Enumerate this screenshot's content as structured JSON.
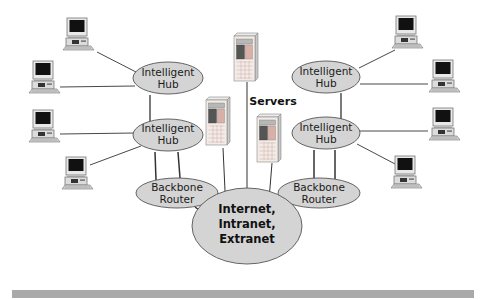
{
  "diagram": {
    "nodes": {
      "left_hub_top": {
        "label_line1": "Intelligent",
        "label_line2": "Hub"
      },
      "left_hub_bottom": {
        "label_line1": "Intelligent",
        "label_line2": "Hub"
      },
      "left_router": {
        "label_line1": "Backbone",
        "label_line2": "Router"
      },
      "right_hub_top": {
        "label_line1": "Intelligent",
        "label_line2": "Hub"
      },
      "right_hub_bottom": {
        "label_line1": "Intelligent",
        "label_line2": "Hub"
      },
      "right_router": {
        "label_line1": "Backbone",
        "label_line2": "Router"
      },
      "internet": {
        "line1": "Internet,",
        "line2": "Intranet,",
        "line3": "Extranet"
      }
    },
    "servers_label": "Servers",
    "computers_count": 8,
    "servers_count": 3,
    "colors": {
      "ellipse_fill": "#d4d4d4",
      "ellipse_stroke": "#555555",
      "line": "#333333",
      "footer_bar": "#a9a9a9"
    }
  }
}
